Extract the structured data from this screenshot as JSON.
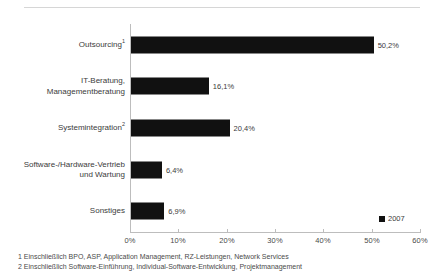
{
  "chart_data": {
    "type": "bar",
    "orientation": "horizontal",
    "title": "",
    "xlabel": "",
    "ylabel": "",
    "categories": [
      "Outsourcing",
      "IT-Beratung, Managementberatung",
      "Systemintegration",
      "Software-/Hardware-Vertrieb und Wartung",
      "Sonstiges"
    ],
    "category_lines": [
      [
        "Outsourcing"
      ],
      [
        "IT-Beratung,",
        "Managementberatung"
      ],
      [
        "Systemintegration"
      ],
      [
        "Software-/Hardware-Vertrieb",
        "und Wartung"
      ],
      [
        "Sonstiges"
      ]
    ],
    "category_footnote_marks": [
      "1",
      "",
      "2",
      "",
      ""
    ],
    "values": [
      50.2,
      16.1,
      20.4,
      6.4,
      6.9
    ],
    "value_labels": [
      "50,2%",
      "16,1%",
      "20,4%",
      "6,4%",
      "6,9%"
    ],
    "xlim": [
      0,
      60
    ],
    "xticks": [
      0,
      10,
      20,
      30,
      40,
      50,
      60
    ],
    "xtick_labels": [
      "0%",
      "10%",
      "20%",
      "30%",
      "40%",
      "50%",
      "60%"
    ],
    "grid": false,
    "legend_position": "bottom-right",
    "series": [
      {
        "name": "2007",
        "values": [
          50.2,
          16.1,
          20.4,
          6.4,
          6.9
        ]
      }
    ],
    "bar_color": "#111111"
  },
  "legend": {
    "label": "2007",
    "swatch_name": "legend-swatch-2007"
  },
  "footnotes": [
    "1 Einschließlich BPO, ASP, Application Management, RZ-Leistungen, Network Services",
    "2 Einschließlich Software-Einführung, Individual-Software-Entwicklung, Projektmanagement"
  ]
}
